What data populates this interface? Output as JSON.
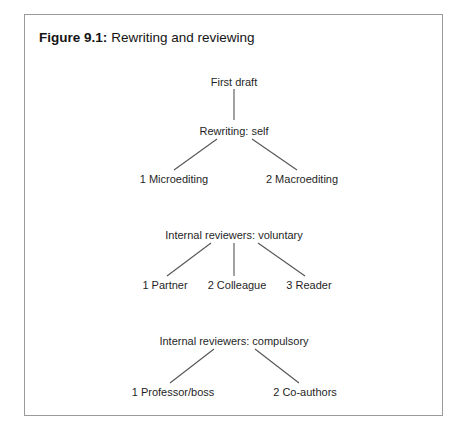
{
  "figure": {
    "label": "Figure 9.1:",
    "title": "Rewriting and reviewing",
    "border_color": "#9a9a9a",
    "line_color": "#555555",
    "text_color": "#1f1f1f",
    "background": "#ffffff"
  },
  "diagram": {
    "type": "tree",
    "trees": [
      {
        "id": "rewriting-tree",
        "root": "First draft",
        "mid": "Rewriting: self",
        "children": [
          "1 Microediting",
          "2 Macroediting"
        ]
      },
      {
        "id": "voluntary-reviewers-tree",
        "root": "Internal reviewers: voluntary",
        "children": [
          "1 Partner",
          "2 Colleague",
          "3 Reader"
        ]
      },
      {
        "id": "compulsory-reviewers-tree",
        "root": "Internal reviewers: compulsory",
        "children": [
          "1 Professor/boss",
          "2 Co-authors"
        ]
      }
    ]
  }
}
